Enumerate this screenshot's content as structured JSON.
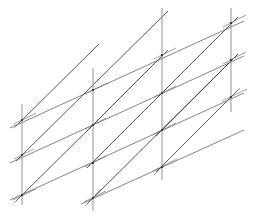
{
  "figure": {
    "type": "line-lattice-diagram",
    "canvas": {
      "width": 258,
      "height": 222,
      "background": "#ffffff"
    },
    "style": {
      "vertical_color": "#8a8a8a",
      "shallow_color": "#707070",
      "steep_color": "#3a3a3a",
      "node_color": "#2b2b2b",
      "vertical_width": 1.0,
      "shallow_width": 0.9,
      "steep_width": 0.9,
      "stub_width": 0.8,
      "node_radius": 1.1
    }
  },
  "geometry": {
    "column_x": [
      22,
      93,
      162,
      231
    ],
    "vertical_lines": [
      {
        "name": "vertical-col-1",
        "x": 22,
        "y1": 104,
        "y2": 205
      },
      {
        "name": "vertical-col-2",
        "x": 93,
        "y1": 68,
        "y2": 211
      },
      {
        "name": "vertical-col-3",
        "x": 162,
        "y1": 8,
        "y2": 180
      },
      {
        "name": "vertical-col-4",
        "x": 231,
        "y1": 8,
        "y2": 112
      }
    ],
    "shallow_diagonals": [
      {
        "name": "shallow-row-1",
        "x1": 10,
        "y1": 128,
        "x2": 244,
        "y2": 21
      },
      {
        "name": "shallow-row-2",
        "x1": 10,
        "y1": 163,
        "x2": 244,
        "y2": 56
      },
      {
        "name": "shallow-row-3",
        "x1": 10,
        "y1": 200,
        "x2": 244,
        "y2": 93
      },
      {
        "name": "shallow-row-4",
        "x1": 81,
        "y1": 204,
        "x2": 244,
        "y2": 130
      }
    ],
    "steep_diagonals": [
      {
        "name": "steep-line-1",
        "x1": 16,
        "y1": 201,
        "x2": 99,
        "y2": 119
      },
      {
        "name": "steep-line-2",
        "x1": 16,
        "y1": 161,
        "x2": 168,
        "y2": 11
      },
      {
        "name": "steep-line-3",
        "x1": 16,
        "y1": 126,
        "x2": 99,
        "y2": 44
      },
      {
        "name": "steep-line-4",
        "x1": 87,
        "y1": 204,
        "x2": 238,
        "y2": 54
      },
      {
        "name": "steep-line-5",
        "x1": 87,
        "y1": 168,
        "x2": 168,
        "y2": 87
      },
      {
        "name": "steep-line-6",
        "x1": 87,
        "y1": 131,
        "x2": 168,
        "y2": 50
      },
      {
        "name": "steep-line-7",
        "x1": 156,
        "y1": 172,
        "x2": 238,
        "y2": 90
      },
      {
        "name": "steep-line-8",
        "x1": 156,
        "y1": 136,
        "x2": 238,
        "y2": 54
      },
      {
        "name": "steep-line-9",
        "x1": 156,
        "y1": 99,
        "x2": 238,
        "y2": 17
      }
    ],
    "nodes": [
      {
        "name": "node-c1-r1",
        "x": 22,
        "y": 120,
        "column": 1,
        "row": 1
      },
      {
        "name": "node-c1-r2",
        "x": 22,
        "y": 155,
        "column": 1,
        "row": 2
      },
      {
        "name": "node-c1-r3",
        "x": 22,
        "y": 195,
        "column": 1,
        "row": 3
      },
      {
        "name": "node-c2-r0",
        "x": 93,
        "y": 90,
        "column": 2,
        "row": 0
      },
      {
        "name": "node-c2-r1",
        "x": 93,
        "y": 125,
        "column": 2,
        "row": 1
      },
      {
        "name": "node-c2-r2",
        "x": 93,
        "y": 163,
        "column": 2,
        "row": 2
      },
      {
        "name": "node-c2-r3",
        "x": 93,
        "y": 198,
        "column": 2,
        "row": 3
      },
      {
        "name": "node-c3-r-1",
        "x": 162,
        "y": 55,
        "column": 3,
        "row": -1
      },
      {
        "name": "node-c3-r0",
        "x": 162,
        "y": 93,
        "column": 3,
        "row": 0
      },
      {
        "name": "node-c3-r1",
        "x": 162,
        "y": 130,
        "column": 3,
        "row": 1
      },
      {
        "name": "node-c3-r2",
        "x": 162,
        "y": 167,
        "column": 3,
        "row": 2
      },
      {
        "name": "node-c4-r-2",
        "x": 231,
        "y": 23,
        "column": 4,
        "row": -2
      },
      {
        "name": "node-c4-r-1",
        "x": 231,
        "y": 60,
        "column": 4,
        "row": -1
      },
      {
        "name": "node-c4-r0",
        "x": 231,
        "y": 97,
        "column": 4,
        "row": 0
      }
    ],
    "stubs": [
      {
        "name": "stub-c1-r1-a",
        "x1": 14,
        "y1": 124,
        "x2": 36,
        "y2": 113
      },
      {
        "name": "stub-c1-r1-b",
        "x1": 14,
        "y1": 128,
        "x2": 30,
        "y2": 112
      },
      {
        "name": "stub-c1-r2-a",
        "x1": 14,
        "y1": 159,
        "x2": 34,
        "y2": 149
      },
      {
        "name": "stub-c1-r3-a",
        "x1": 13,
        "y1": 200,
        "x2": 36,
        "y2": 189
      },
      {
        "name": "stub-c1-r3-b",
        "x1": 14,
        "y1": 203,
        "x2": 31,
        "y2": 186
      },
      {
        "name": "stub-c2-r0-a",
        "x1": 85,
        "y1": 94,
        "x2": 107,
        "y2": 83
      },
      {
        "name": "stub-c2-r1-a",
        "x1": 85,
        "y1": 129,
        "x2": 106,
        "y2": 118
      },
      {
        "name": "stub-c2-r2-a",
        "x1": 85,
        "y1": 167,
        "x2": 106,
        "y2": 156
      },
      {
        "name": "stub-c2-r3-a",
        "x1": 84,
        "y1": 202,
        "x2": 106,
        "y2": 191
      },
      {
        "name": "stub-c2-r3-b",
        "x1": 85,
        "y1": 206,
        "x2": 101,
        "y2": 189
      },
      {
        "name": "stub-c3-r-1-a",
        "x1": 154,
        "y1": 59,
        "x2": 176,
        "y2": 48
      },
      {
        "name": "stub-c3-r0-a",
        "x1": 154,
        "y1": 97,
        "x2": 176,
        "y2": 86
      },
      {
        "name": "stub-c3-r1-a",
        "x1": 154,
        "y1": 134,
        "x2": 176,
        "y2": 123
      },
      {
        "name": "stub-c3-r2-a",
        "x1": 153,
        "y1": 171,
        "x2": 177,
        "y2": 159
      },
      {
        "name": "stub-c3-r2-b",
        "x1": 154,
        "y1": 175,
        "x2": 170,
        "y2": 158
      },
      {
        "name": "stub-c4-r-2-a",
        "x1": 223,
        "y1": 27,
        "x2": 246,
        "y2": 15
      },
      {
        "name": "stub-c4-r-1-a",
        "x1": 223,
        "y1": 64,
        "x2": 246,
        "y2": 52
      },
      {
        "name": "stub-c4-r0-a",
        "x1": 222,
        "y1": 101,
        "x2": 247,
        "y2": 89
      },
      {
        "name": "stub-c4-r0-b",
        "x1": 223,
        "y1": 105,
        "x2": 240,
        "y2": 88
      }
    ]
  }
}
